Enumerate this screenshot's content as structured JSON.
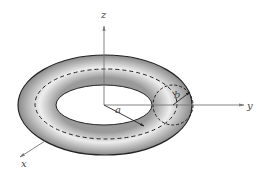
{
  "diagram": {
    "axes": {
      "z": "z",
      "y": "y",
      "x": "x"
    },
    "labels": {
      "a": "a",
      "b": "b"
    },
    "colors": {
      "axis": "#777777",
      "outline": "#222222",
      "shade_dark": "#8a8a8a",
      "shade_light": "#f0f0f0"
    }
  }
}
